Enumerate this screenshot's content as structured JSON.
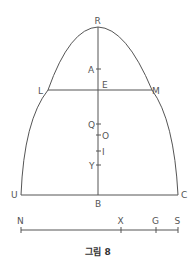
{
  "figure": {
    "caption": "그림 8",
    "colors": {
      "line": "#555555",
      "text": "#555555",
      "background": "#ffffff"
    },
    "points": {
      "R": "R",
      "A": "A",
      "E": "E",
      "L": "L",
      "M": "M",
      "Q": "Q",
      "O": "O",
      "I": "I",
      "Y": "Y",
      "U": "U",
      "B": "B",
      "C": "C"
    },
    "scale_line": {
      "labels": [
        "N",
        "X",
        "G",
        "S"
      ]
    }
  }
}
